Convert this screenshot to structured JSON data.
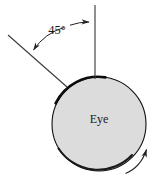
{
  "figure": {
    "name": "eye-rotation-angle-diagram",
    "background_color": "#ffffff",
    "labels": {
      "angle": "45°",
      "body": "Eye"
    },
    "colors": {
      "sphere_fill": "#dcdcdc",
      "sphere_outline": "#111111",
      "line": "#444444",
      "text": "#1a1a1a",
      "arrow": "#222222"
    },
    "geometry": {
      "sphere": {
        "center_x": 99,
        "center_y": 124,
        "radius": 47
      },
      "vertical_reference_line": {
        "x": 95,
        "y_top": 5,
        "y_bottom": 79
      },
      "incident_ray": {
        "x1": 8,
        "y1": 35,
        "x2": 67,
        "y2": 87
      },
      "angle_arc": {
        "vertex_x": 95,
        "vertex_y": 79,
        "start_deg": 225,
        "end_deg": 270,
        "radius": 62
      },
      "rotation_arrow": {
        "start_x": 126,
        "start_y": 173,
        "end_x": 148,
        "end_y": 148,
        "direction": "counterclockwise"
      }
    }
  }
}
